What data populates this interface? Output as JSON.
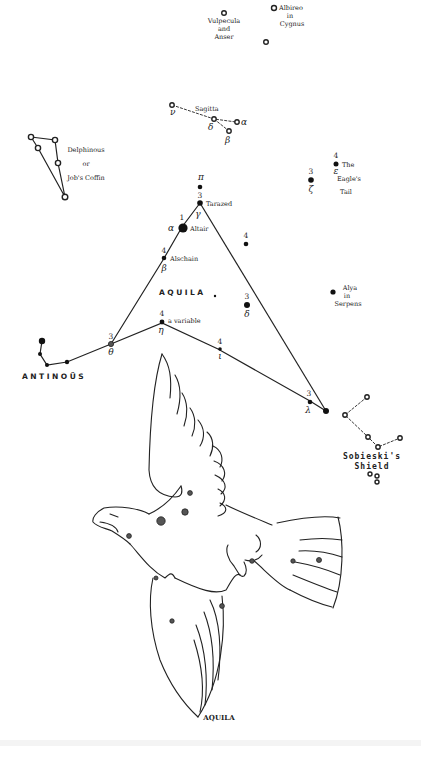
{
  "figure": {
    "title": "AQUILA",
    "central_label": "AQUILA",
    "background": "#ffffff",
    "ink": "#222222"
  },
  "constellations": {
    "vulpecula": {
      "label_l1": "Vulpecula",
      "label_l2": "and",
      "label_l3": "Anser"
    },
    "cygnus": {
      "label_l1": "Albireo",
      "label_l2": "in",
      "label_l3": "Cygnus"
    },
    "sagitta": {
      "label": "Sagitta",
      "stars": [
        {
          "greek": "ν"
        },
        {
          "greek": "δ"
        },
        {
          "greek": "α"
        },
        {
          "greek": "β"
        }
      ]
    },
    "delphinus": {
      "label_l1": "Delphinous",
      "label_l2": "or",
      "label_l3": "Job's Coffin"
    },
    "antinous": {
      "label": "ANTINOÜS"
    },
    "sobieski": {
      "label_l1": "Sobieski's",
      "label_l2": "Shield"
    },
    "serpens": {
      "label_l1": "Alya",
      "label_l2": "in",
      "label_l3": "Serpens"
    },
    "eagles_tail": {
      "label_l1": "The",
      "label_l2": "Eagle's",
      "label_l3": "Tail"
    }
  },
  "aquila_stars": {
    "pi": {
      "greek": "π"
    },
    "gamma": {
      "mag": "3",
      "greek": "γ",
      "name": "Tarazed"
    },
    "alpha": {
      "mag": "1",
      "greek": "α",
      "name": "Altair"
    },
    "beta": {
      "mag": "4",
      "greek": "β",
      "name": "Alschain"
    },
    "eta": {
      "mag": "4",
      "greek": "η",
      "name": "a variable"
    },
    "theta": {
      "mag": "3",
      "greek": "θ"
    },
    "delta": {
      "mag": "3",
      "greek": "δ"
    },
    "iota": {
      "mag": "4",
      "greek": "ι"
    },
    "lambda": {
      "mag": "3",
      "greek": "λ"
    },
    "zeta": {
      "mag": "3",
      "greek": "ζ"
    },
    "epsilon": {
      "mag": "4",
      "greek": "ε"
    },
    "unnamed_4": {
      "mag": "4"
    }
  }
}
